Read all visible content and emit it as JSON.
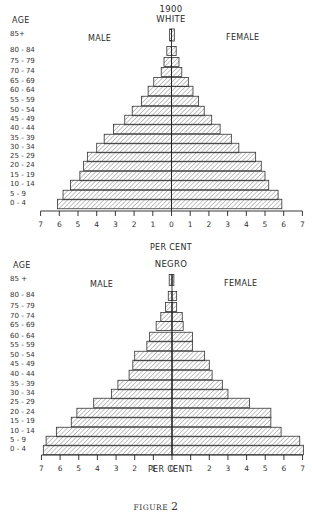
{
  "figure_caption": {
    "label": "FIGURE",
    "number": "2"
  },
  "chart_data": [
    {
      "type": "bar",
      "subtype": "population-pyramid",
      "title": "1900",
      "subtitle": "WHITE",
      "ylabel": "AGE",
      "xlabel": "PER CENT",
      "left_label": "MALE",
      "right_label": "FEMALE",
      "xlim": [
        -7,
        7
      ],
      "xticks": [
        "7",
        "6",
        "5",
        "4",
        "3",
        "2",
        "1",
        "0",
        "1",
        "2",
        "3",
        "4",
        "5",
        "6",
        "7"
      ],
      "categories": [
        "85+",
        "80 - 84",
        "75 - 79",
        "70 - 74",
        "65 - 69",
        "60 - 64",
        "55 - 59",
        "50 - 54",
        "45 - 49",
        "40 - 44",
        "35 - 39",
        "30 - 34",
        "25 - 29",
        "20 - 24",
        "15 - 19",
        "10 - 14",
        "5 - 9",
        "0 - 4"
      ],
      "series": [
        {
          "name": "MALE",
          "values": [
            0.1,
            0.25,
            0.4,
            0.55,
            0.95,
            1.25,
            1.6,
            2.1,
            2.5,
            3.1,
            3.6,
            4.0,
            4.5,
            4.7,
            4.9,
            5.4,
            5.8,
            6.1
          ]
        },
        {
          "name": "FEMALE",
          "values": [
            0.15,
            0.25,
            0.4,
            0.55,
            0.9,
            1.15,
            1.45,
            1.75,
            2.15,
            2.6,
            3.2,
            3.6,
            4.5,
            4.8,
            5.0,
            5.2,
            5.7,
            5.9
          ]
        }
      ],
      "grid": false,
      "fill": "diagonal-hatch"
    },
    {
      "type": "bar",
      "subtype": "population-pyramid",
      "title": "NEGRO",
      "ylabel": "AGE",
      "xlabel": "PER CENT",
      "left_label": "MALE",
      "right_label": "FEMALE",
      "xlim": [
        -7,
        7
      ],
      "xticks": [
        "7",
        "6",
        "5",
        "4",
        "3",
        "2",
        "1",
        "0",
        "1",
        "2",
        "3",
        "4",
        "5",
        "6",
        "7"
      ],
      "categories": [
        "85 +",
        "80 - 84",
        "75 - 79",
        "70 - 74",
        "65 - 69",
        "60 - 64",
        "55 - 59",
        "50 - 54",
        "45 - 49",
        "40 - 44",
        "35 - 39",
        "30 - 34",
        "25 - 29",
        "20 - 24",
        "15 - 19",
        "10 - 14",
        "5 - 9",
        "0 - 4"
      ],
      "series": [
        {
          "name": "MALE",
          "values": [
            0.15,
            0.2,
            0.35,
            0.6,
            0.85,
            1.2,
            1.35,
            2.0,
            2.1,
            2.3,
            2.9,
            3.25,
            4.2,
            5.1,
            5.4,
            6.2,
            6.75,
            6.9
          ]
        },
        {
          "name": "FEMALE",
          "values": [
            0.1,
            0.25,
            0.25,
            0.55,
            0.6,
            1.1,
            1.1,
            1.75,
            2.0,
            2.15,
            2.7,
            3.0,
            4.15,
            5.3,
            5.3,
            5.85,
            6.85,
            7.05
          ]
        }
      ],
      "grid": false,
      "fill": "diagonal-hatch"
    }
  ]
}
